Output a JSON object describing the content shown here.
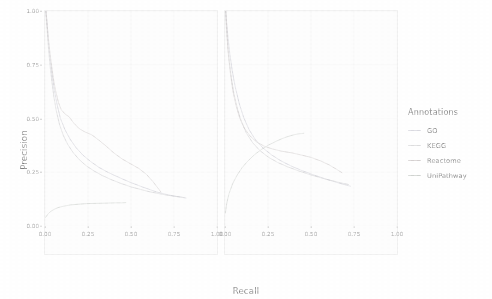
{
  "chart_data": {
    "type": "line",
    "title": "",
    "xlabel": "Recall",
    "ylabel": "Precision",
    "xlim": [
      0,
      1
    ],
    "ylim": [
      0,
      1
    ],
    "grid": true,
    "legend_position": "right",
    "legend_title": "Annotations",
    "x_ticks": [
      "0.00",
      "0.25",
      "0.50",
      "0.75",
      "1.00"
    ],
    "y_ticks": [
      "0.00",
      "0.25",
      "0.50",
      "0.75",
      "1.00"
    ],
    "x_tick_values": [
      0,
      0.25,
      0.5,
      0.75,
      1
    ],
    "y_tick_values": [
      0,
      0.25,
      0.5,
      0.75,
      1
    ],
    "colors": {
      "GO": "#b8b8c4",
      "KEGG": "#bdbdc0",
      "Reactome": "#c2bcbc",
      "UniPathway": "#bcc0bc"
    },
    "panels": [
      {
        "name": "panel-left",
        "series": [
          {
            "name": "GO",
            "x": [
              0.005,
              0.01,
              0.016,
              0.022,
              0.03,
              0.042,
              0.055,
              0.07,
              0.09,
              0.115,
              0.145,
              0.18,
              0.22,
              0.265,
              0.315,
              0.37,
              0.43,
              0.49,
              0.545,
              0.6,
              0.65,
              0.7,
              0.745,
              0.79,
              0.82
            ],
            "y": [
              1.0,
              0.96,
              0.905,
              0.84,
              0.775,
              0.7,
              0.63,
              0.565,
              0.5,
              0.45,
              0.405,
              0.365,
              0.33,
              0.3,
              0.272,
              0.248,
              0.226,
              0.205,
              0.188,
              0.172,
              0.158,
              0.148,
              0.14,
              0.134,
              0.13
            ]
          },
          {
            "name": "KEGG",
            "x": [
              0.004,
              0.009,
              0.015,
              0.021,
              0.029,
              0.04,
              0.052,
              0.066,
              0.084,
              0.106,
              0.133,
              0.165,
              0.2,
              0.24,
              0.285,
              0.335,
              0.39,
              0.445,
              0.5,
              0.555,
              0.61,
              0.665,
              0.715,
              0.765,
              0.81
            ],
            "y": [
              1.0,
              0.95,
              0.888,
              0.82,
              0.748,
              0.672,
              0.6,
              0.534,
              0.474,
              0.422,
              0.378,
              0.34,
              0.308,
              0.28,
              0.256,
              0.234,
              0.214,
              0.197,
              0.182,
              0.17,
              0.159,
              0.15,
              0.143,
              0.137,
              0.132
            ]
          },
          {
            "name": "Reactome",
            "x": [
              0.006,
              0.013,
              0.022,
              0.034,
              0.048,
              0.062,
              0.078,
              0.095,
              0.118,
              0.14,
              0.168,
              0.2,
              0.236,
              0.272,
              0.312,
              0.355,
              0.4,
              0.448,
              0.496,
              0.545,
              0.59,
              0.628,
              0.655,
              0.672
            ],
            "y": [
              1.0,
              0.93,
              0.855,
              0.77,
              0.69,
              0.628,
              0.575,
              0.54,
              0.52,
              0.508,
              0.478,
              0.452,
              0.436,
              0.424,
              0.4,
              0.372,
              0.34,
              0.312,
              0.29,
              0.268,
              0.24,
              0.206,
              0.178,
              0.16
            ]
          },
          {
            "name": "UniPathway",
            "x": [
              0.003,
              0.008,
              0.014,
              0.02,
              0.028,
              0.037,
              0.048,
              0.06,
              0.074,
              0.09,
              0.108,
              0.128,
              0.15,
              0.175,
              0.205,
              0.24,
              0.28,
              0.325,
              0.37,
              0.41,
              0.445,
              0.47
            ],
            "y": [
              0.04,
              0.045,
              0.052,
              0.058,
              0.064,
              0.07,
              0.075,
              0.08,
              0.085,
              0.089,
              0.092,
              0.095,
              0.098,
              0.1,
              0.102,
              0.104,
              0.105,
              0.106,
              0.107,
              0.108,
              0.108,
              0.109
            ]
          }
        ]
      },
      {
        "name": "panel-right",
        "series": [
          {
            "name": "GO",
            "x": [
              0.004,
              0.01,
              0.018,
              0.028,
              0.042,
              0.06,
              0.082,
              0.108,
              0.14,
              0.178,
              0.222,
              0.272,
              0.325,
              0.382,
              0.44,
              0.5,
              0.558,
              0.612,
              0.662,
              0.705,
              0.73
            ],
            "y": [
              1.0,
              0.94,
              0.872,
              0.8,
              0.722,
              0.645,
              0.572,
              0.506,
              0.448,
              0.4,
              0.362,
              0.33,
              0.303,
              0.28,
              0.26,
              0.242,
              0.226,
              0.212,
              0.2,
              0.19,
              0.185
            ]
          },
          {
            "name": "KEGG",
            "x": [
              0.003,
              0.008,
              0.015,
              0.024,
              0.036,
              0.052,
              0.072,
              0.096,
              0.126,
              0.162,
              0.204,
              0.252,
              0.305,
              0.362,
              0.422,
              0.482,
              0.54,
              0.595,
              0.645,
              0.69,
              0.718
            ],
            "y": [
              1.0,
              0.925,
              0.848,
              0.77,
              0.692,
              0.616,
              0.546,
              0.484,
              0.43,
              0.386,
              0.35,
              0.32,
              0.296,
              0.276,
              0.258,
              0.242,
              0.228,
              0.216,
              0.206,
              0.198,
              0.193
            ]
          },
          {
            "name": "Reactome",
            "x": [
              0.005,
              0.012,
              0.02,
              0.032,
              0.046,
              0.064,
              0.086,
              0.112,
              0.144,
              0.182,
              0.226,
              0.276,
              0.33,
              0.388,
              0.446,
              0.504,
              0.558,
              0.606,
              0.648,
              0.68
            ],
            "y": [
              1.0,
              0.89,
              0.795,
              0.706,
              0.628,
              0.56,
              0.502,
              0.456,
              0.42,
              0.392,
              0.372,
              0.358,
              0.348,
              0.34,
              0.33,
              0.318,
              0.302,
              0.284,
              0.264,
              0.248
            ]
          },
          {
            "name": "UniPathway",
            "x": [
              0.002,
              0.01,
              0.024,
              0.044,
              0.07,
              0.1,
              0.135,
              0.172,
              0.212,
              0.252,
              0.292,
              0.33,
              0.366,
              0.398,
              0.424,
              0.444,
              0.458
            ],
            "y": [
              0.06,
              0.105,
              0.152,
              0.196,
              0.236,
              0.272,
              0.304,
              0.332,
              0.356,
              0.376,
              0.392,
              0.406,
              0.416,
              0.424,
              0.428,
              0.43,
              0.431
            ]
          }
        ]
      }
    ],
    "legend_entries": [
      {
        "label": "GO",
        "color": "#b8b8c4"
      },
      {
        "label": "KEGG",
        "color": "#bdbdc0"
      },
      {
        "label": "Reactome",
        "color": "#c2bcbc"
      },
      {
        "label": "UniPathway",
        "color": "#bcc0bc"
      }
    ]
  }
}
